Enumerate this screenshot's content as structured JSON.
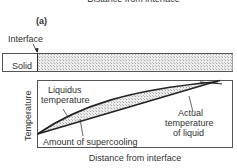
{
  "figure": {
    "top_cutoff_label": "Distance from interface",
    "panel_label": "(a)",
    "interface_label": "Interface",
    "solid_label": "Solid",
    "y_axis_label": "Temperature",
    "x_axis_label": "Distance from interface",
    "annotations": {
      "liquidus": [
        "Liquidus",
        "temperature"
      ],
      "supercooling": "Amount of supercooling",
      "actual": [
        "Actual",
        "temperature",
        "of liquid"
      ]
    },
    "colors": {
      "line": "#222222",
      "hatch_fill": "#cfcfcf",
      "border": "#555555"
    }
  }
}
